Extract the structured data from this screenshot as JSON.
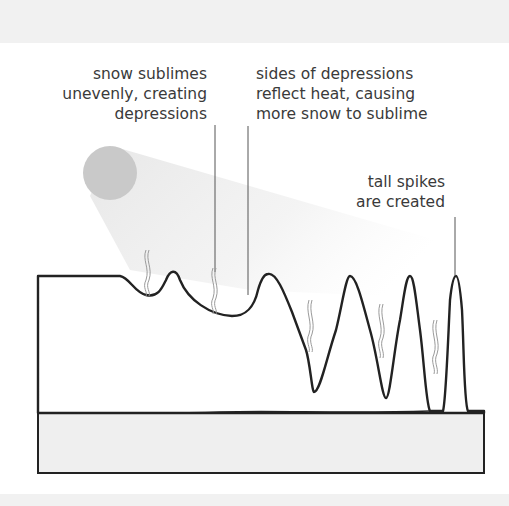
{
  "diagram": {
    "annotations": [
      {
        "id": "uneven-sublimation",
        "text": "snow sublimes\nunevenly, creating\ndepressions"
      },
      {
        "id": "reflected-heat",
        "text": "sides of depressions\nreflect heat, causing\nmore snow to sublime"
      },
      {
        "id": "tall-spikes",
        "text": "tall spikes\nare created"
      }
    ],
    "elements": {
      "sun": "sun-circle",
      "sunbeam": "light-beam",
      "snow_layer": "snow-surface",
      "ground": "ground-layer",
      "vapor": "sublimation-vapor-wisps"
    },
    "colors": {
      "outline": "#222222",
      "sun": "#c9c9c9",
      "beam": "#ececec",
      "ground": "#efefef",
      "band": "#f1f1f1",
      "leader": "#555555",
      "vapor": "#9a9a9a"
    }
  }
}
